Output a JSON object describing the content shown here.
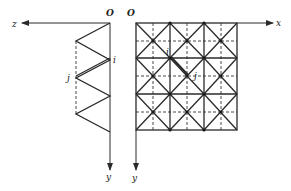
{
  "figure": {
    "side_view": {
      "origin_label": "O",
      "horizontal_axis_label": "z",
      "vertical_axis_label": "y",
      "node_labels": [
        "i",
        "j"
      ]
    },
    "plan_view": {
      "origin_label": "O",
      "horizontal_axis_label": "x",
      "vertical_axis_label": "y",
      "node_labels": [
        "i",
        "j"
      ],
      "grid": {
        "columns": 3,
        "rows": 3
      }
    }
  },
  "colors": {
    "line": "#2a2a2a",
    "background": "#ffffff"
  }
}
